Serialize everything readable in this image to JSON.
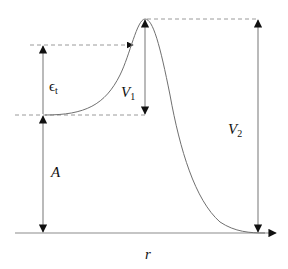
{
  "diagram": {
    "type": "potential-energy-barrier",
    "labels": {
      "epsilon": {
        "main": "ϵ",
        "sub": "t"
      },
      "v1": {
        "main": "V",
        "sub": "1"
      },
      "v2": {
        "main": "V",
        "sub": "2"
      },
      "a": {
        "main": "A"
      },
      "r": {
        "main": "r"
      }
    },
    "colors": {
      "curve": "#707070",
      "arrows": "#8c8c8c",
      "dashed": "#9a9a9a",
      "arrowhead": "#111111",
      "text": "#111111"
    }
  }
}
